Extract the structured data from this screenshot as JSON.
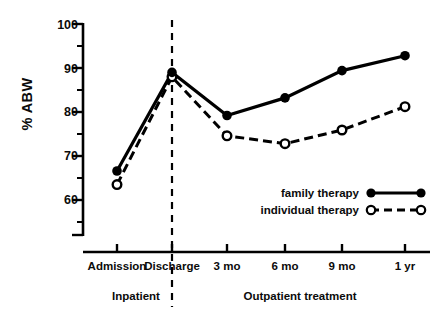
{
  "chart_data": {
    "type": "line",
    "title": "",
    "xlabel": "",
    "ylabel": "% ABW",
    "categories": [
      "Admission",
      "Discharge",
      "3 mo",
      "6 mo",
      "9 mo",
      "1 yr"
    ],
    "ylim": [
      55,
      102
    ],
    "yticks": [
      60,
      70,
      80,
      90,
      100
    ],
    "ytick_labels": [
      "60",
      "70",
      "80",
      "90",
      "100"
    ],
    "grid": false,
    "legend_position": "lower right",
    "series": [
      {
        "name": "family therapy",
        "marker": "filled-circle",
        "linestyle": "solid",
        "color": "#000000",
        "values": [
          66.6,
          89.0,
          79.2,
          83.2,
          89.4,
          92.8
        ]
      },
      {
        "name": "individual therapy",
        "marker": "open-circle",
        "linestyle": "dashed",
        "color": "#000000",
        "values": [
          63.5,
          88.0,
          74.6,
          72.8,
          75.9,
          81.2
        ]
      }
    ],
    "annotations": [
      {
        "name": "phase-inpatient",
        "text": "Inpatient",
        "span": [
          "Admission",
          "Discharge"
        ]
      },
      {
        "name": "phase-outpatient",
        "text": "Outpatient treatment",
        "span": [
          "3 mo",
          "1 yr"
        ]
      },
      {
        "name": "phase-divider",
        "text": "",
        "at": "Discharge",
        "style": "vertical-dashed"
      }
    ]
  },
  "axis": {
    "y_label": "% ABW",
    "y_tick_labels": [
      "100",
      "90",
      "80",
      "70",
      "60"
    ],
    "x_tick_labels": [
      "Admission",
      "Discharge",
      "3 mo",
      "6 mo",
      "9 mo",
      "1 yr"
    ]
  },
  "phases": {
    "inpatient": "Inpatient",
    "outpatient": "Outpatient treatment"
  },
  "legend": {
    "items": [
      {
        "label": "family therapy",
        "marker": "filled-circle",
        "line": "solid"
      },
      {
        "label": "individual therapy",
        "marker": "open-circle",
        "line": "dashed"
      }
    ]
  },
  "colors": {
    "ink": "#000000",
    "background": "#ffffff"
  }
}
